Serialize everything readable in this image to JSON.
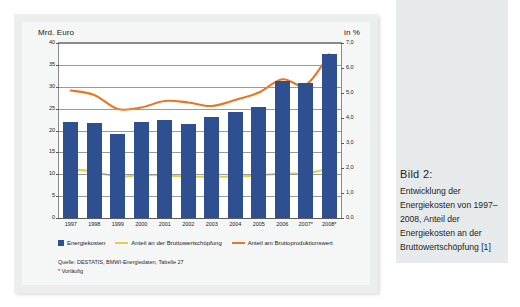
{
  "chart_data": {
    "type": "bar",
    "title": "",
    "xlabel": "",
    "ylabel": "Mrd. Euro",
    "y2label": "in %",
    "grid": true,
    "legend_position": "bottom-left",
    "categories": [
      "1997",
      "1998",
      "1999",
      "2000",
      "2001",
      "2002",
      "2003",
      "2004",
      "2005",
      "2006",
      "2007*",
      "2008*"
    ],
    "ylim": [
      0,
      40
    ],
    "yticks": [
      "0",
      "5",
      "10",
      "15",
      "20",
      "25",
      "30",
      "35",
      "40"
    ],
    "y2lim": [
      0,
      7
    ],
    "y2ticks": [
      "0,0",
      "1,0",
      "2,0",
      "3,0",
      "4,0",
      "5,0",
      "6,0",
      "7,0"
    ],
    "series": [
      {
        "name": "Energiekosten",
        "type": "bar",
        "axis": "left",
        "unit": "Mrd. Euro",
        "color": "#2e4f90",
        "values": [
          22.0,
          21.8,
          19.3,
          22.0,
          22.3,
          21.4,
          23.2,
          24.2,
          25.3,
          31.3,
          30.8,
          37.5
        ]
      },
      {
        "name": "Anteil an der Bruttowertschöpfung",
        "type": "line",
        "axis": "right",
        "unit": "%",
        "color": "#e2d04a",
        "values": [
          1.95,
          1.85,
          1.65,
          1.72,
          1.7,
          1.66,
          1.65,
          1.66,
          1.7,
          1.78,
          1.78,
          1.98
        ]
      },
      {
        "name": "Anteil am Bruttoproduktionswert",
        "type": "line",
        "axis": "right",
        "unit": "%",
        "color": "#e87722",
        "values": [
          5.1,
          4.92,
          4.36,
          4.42,
          4.68,
          4.62,
          4.48,
          4.72,
          5.02,
          5.55,
          5.32,
          6.55
        ]
      }
    ],
    "source_lines": [
      "Quelle: DESTATIS, BMWI-Energiedaten, Tabelle 27",
      "* Vorläufig"
    ]
  },
  "caption": {
    "title": "Bild 2:",
    "body": "Entwicklung der Energiekosten von 1997–2008, Anteil der Energiekosten an der Bruttowertschöpfung [1]"
  }
}
